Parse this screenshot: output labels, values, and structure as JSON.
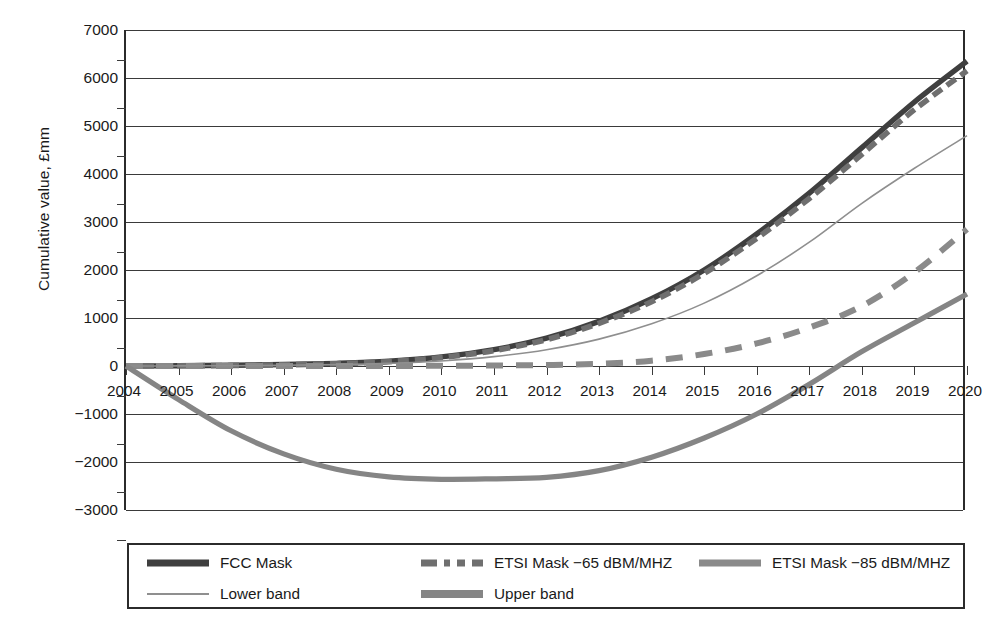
{
  "chart_data": {
    "type": "line",
    "title": "",
    "xlabel": "",
    "ylabel": "Cumulative value, £mm",
    "xlim": [
      2004,
      2020
    ],
    "ylim": [
      -3000,
      7000
    ],
    "grid": true,
    "legend_position": "bottom",
    "categories": [
      2004,
      2005,
      2006,
      2007,
      2008,
      2009,
      2010,
      2011,
      2012,
      2013,
      2014,
      2015,
      2016,
      2017,
      2018,
      2019,
      2020
    ],
    "yticks": [
      7000,
      6000,
      5000,
      4000,
      3000,
      2000,
      1000,
      0,
      -1000,
      -2000,
      -3000
    ],
    "ytick_labels": [
      "7000",
      "6000",
      "5000",
      "4000",
      "3000",
      "2000",
      "1000",
      "0",
      "−1000",
      "−2000",
      "−3000"
    ],
    "xtick_labels": [
      "2004",
      "2005",
      "2006",
      "2007",
      "2008",
      "2009",
      "2010",
      "2011",
      "2012",
      "2013",
      "2014",
      "2015",
      "2016",
      "2017",
      "2018",
      "2019",
      "2020"
    ],
    "series": [
      {
        "name": "FCC Mask",
        "style": "solid",
        "width": "thick",
        "color": "#3f3f3f",
        "values": [
          0,
          5,
          15,
          30,
          55,
          100,
          190,
          340,
          580,
          930,
          1400,
          2000,
          2750,
          3600,
          4550,
          5500,
          6350
        ]
      },
      {
        "name": "ETSI Mask −65 dBM/MHZ",
        "style": "dashed",
        "width": "thick",
        "color": "#6f6f6f",
        "values": [
          0,
          4,
          12,
          25,
          48,
          90,
          175,
          320,
          550,
          890,
          1340,
          1930,
          2660,
          3490,
          4410,
          5340,
          6150
        ]
      },
      {
        "name": "ETSI Mask −85 dBM/MHZ",
        "style": "dashed",
        "width": "medium",
        "color": "#8a8a8a",
        "values": [
          0,
          0,
          0,
          0,
          0,
          0,
          5,
          10,
          20,
          45,
          110,
          250,
          470,
          800,
          1250,
          1950,
          2850
        ]
      },
      {
        "name": "Lower band",
        "style": "solid",
        "width": "thin",
        "color": "#8f8f8f",
        "values": [
          0,
          2,
          6,
          14,
          28,
          55,
          105,
          195,
          340,
          560,
          880,
          1310,
          1880,
          2580,
          3390,
          4120,
          4800
        ]
      },
      {
        "name": "Upper band",
        "style": "solid",
        "width": "thick",
        "color": "#858585",
        "values": [
          0,
          -700,
          -1350,
          -1830,
          -2150,
          -2310,
          -2360,
          -2350,
          -2320,
          -2180,
          -1900,
          -1500,
          -1000,
          -380,
          300,
          900,
          1500
        ]
      }
    ],
    "legend": [
      {
        "label": "FCC Mask",
        "swatch": "sw-fcc"
      },
      {
        "label": "ETSI Mask −65 dBM/MHZ",
        "swatch": "sw-etsi65"
      },
      {
        "label": "ETSI Mask −85 dBM/MHZ",
        "swatch": "sw-etsi85"
      },
      {
        "label": "Lower band",
        "swatch": "sw-lower"
      },
      {
        "label": "Upper band",
        "swatch": "sw-upper"
      }
    ]
  }
}
